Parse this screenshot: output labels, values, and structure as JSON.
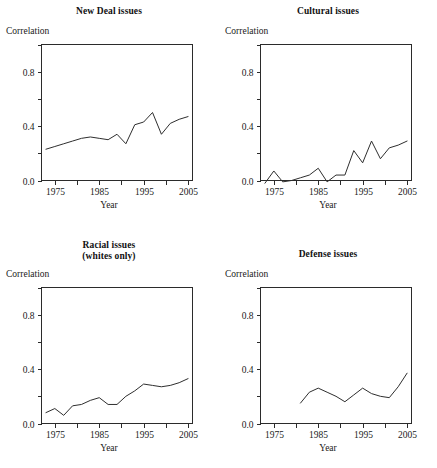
{
  "figure": {
    "panel_count": 4,
    "background": "#ffffff",
    "line_color": "#2e2e2e",
    "axis_color": "#2b2b2b"
  },
  "chart_data": [
    {
      "type": "line",
      "title": "New Deal issues",
      "xlabel": "Year",
      "ylabel": "Correlation",
      "xlim": [
        1972,
        2006
      ],
      "ylim": [
        0.0,
        1.0
      ],
      "grid": false,
      "legend": "none",
      "xticks": [
        1975,
        1980,
        1985,
        1990,
        1995,
        2000,
        2005
      ],
      "xticklabels": [
        "1975",
        "",
        "1985",
        "",
        "1995",
        "",
        "2005"
      ],
      "yticks": [
        0.0,
        0.2,
        0.4,
        0.6,
        0.8,
        1.0
      ],
      "yticklabels": [
        "0.0",
        "",
        "0.4",
        "",
        "0.8",
        ""
      ],
      "x": [
        1973,
        1975,
        1977,
        1979,
        1981,
        1983,
        1985,
        1987,
        1989,
        1991,
        1993,
        1995,
        1997,
        1999,
        2001,
        2003,
        2005
      ],
      "values": [
        0.23,
        0.25,
        0.27,
        0.29,
        0.31,
        0.32,
        0.31,
        0.3,
        0.34,
        0.27,
        0.41,
        0.43,
        0.5,
        0.34,
        0.42,
        0.45,
        0.47
      ]
    },
    {
      "type": "line",
      "title": "Cultural issues",
      "xlabel": "Year",
      "ylabel": "Correlation",
      "xlim": [
        1972,
        2006
      ],
      "ylim": [
        0.0,
        1.0
      ],
      "grid": false,
      "legend": "none",
      "xticks": [
        1975,
        1980,
        1985,
        1990,
        1995,
        2000,
        2005
      ],
      "xticklabels": [
        "1975",
        "",
        "1985",
        "",
        "1995",
        "",
        "2005"
      ],
      "yticks": [
        0.0,
        0.2,
        0.4,
        0.6,
        0.8,
        1.0
      ],
      "yticklabels": [
        "0.0",
        "",
        "0.4",
        "",
        "0.8",
        ""
      ],
      "x": [
        1973,
        1975,
        1977,
        1979,
        1981,
        1983,
        1985,
        1987,
        1989,
        1991,
        1993,
        1995,
        1997,
        1999,
        2001,
        2003,
        2005
      ],
      "values": [
        -0.02,
        0.07,
        -0.01,
        0.0,
        0.02,
        0.04,
        0.09,
        -0.01,
        0.04,
        0.04,
        0.22,
        0.13,
        0.29,
        0.16,
        0.24,
        0.26,
        0.29
      ]
    },
    {
      "type": "line",
      "title": "Racial issues\n(whites only)",
      "xlabel": "Year",
      "ylabel": "Correlation",
      "xlim": [
        1972,
        2006
      ],
      "ylim": [
        0.0,
        1.0
      ],
      "grid": false,
      "legend": "none",
      "xticks": [
        1975,
        1980,
        1985,
        1990,
        1995,
        2000,
        2005
      ],
      "xticklabels": [
        "1975",
        "",
        "1985",
        "",
        "1995",
        "",
        "2005"
      ],
      "yticks": [
        0.0,
        0.2,
        0.4,
        0.6,
        0.8,
        1.0
      ],
      "yticklabels": [
        "0.0",
        "",
        "0.4",
        "",
        "0.8",
        ""
      ],
      "x": [
        1973,
        1975,
        1977,
        1979,
        1981,
        1983,
        1985,
        1987,
        1989,
        1991,
        1993,
        1995,
        1997,
        1999,
        2001,
        2003,
        2005
      ],
      "values": [
        0.08,
        0.11,
        0.06,
        0.13,
        0.14,
        0.17,
        0.19,
        0.14,
        0.14,
        0.2,
        0.24,
        0.29,
        0.28,
        0.27,
        0.28,
        0.3,
        0.33
      ]
    },
    {
      "type": "line",
      "title": "Defense issues",
      "xlabel": "Year",
      "ylabel": "Correlation",
      "xlim": [
        1972,
        2006
      ],
      "ylim": [
        0.0,
        1.0
      ],
      "grid": false,
      "legend": "none",
      "xticks": [
        1975,
        1980,
        1985,
        1990,
        1995,
        2000,
        2005
      ],
      "xticklabels": [
        "1975",
        "",
        "1985",
        "",
        "1995",
        "",
        "2005"
      ],
      "yticks": [
        0.0,
        0.2,
        0.4,
        0.6,
        0.8,
        1.0
      ],
      "yticklabels": [
        "0.0",
        "",
        "0.4",
        "",
        "0.8",
        ""
      ],
      "x": [
        1981,
        1983,
        1985,
        1987,
        1989,
        1991,
        1993,
        1995,
        1997,
        1999,
        2001,
        2003,
        2005
      ],
      "values": [
        0.15,
        0.23,
        0.26,
        0.23,
        0.2,
        0.16,
        0.21,
        0.26,
        0.22,
        0.2,
        0.19,
        0.27,
        0.37
      ]
    }
  ]
}
